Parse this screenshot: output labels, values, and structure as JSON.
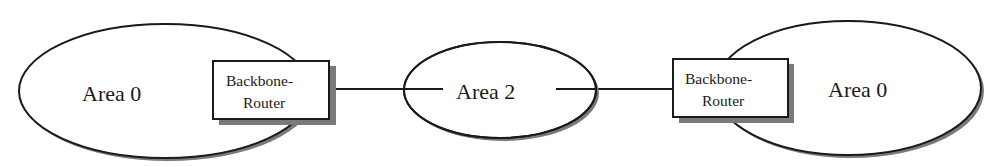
{
  "diagram": {
    "type": "network-topology",
    "colors": {
      "stroke": "#1a1a1a",
      "shadow": "#7a7a7a",
      "fill": "#ffffff"
    },
    "areas": [
      {
        "id": "left",
        "label": "Area 0"
      },
      {
        "id": "middle",
        "label": "Area 2"
      },
      {
        "id": "right",
        "label": "Area 0"
      }
    ],
    "routers": [
      {
        "id": "left-router",
        "line1": "Backbone-",
        "line2": "Router"
      },
      {
        "id": "right-router",
        "line1": "Backbone-",
        "line2": "Router"
      }
    ],
    "links": [
      {
        "from": "left-router",
        "to": "middle"
      },
      {
        "from": "middle",
        "to": "right-router"
      }
    ]
  }
}
